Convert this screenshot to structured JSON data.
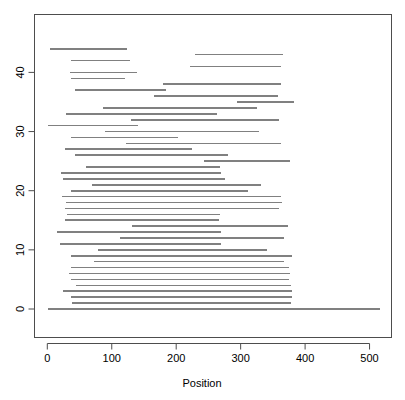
{
  "chart_data": {
    "type": "line",
    "title": "",
    "subtitle": "",
    "xlabel": "Position",
    "ylabel": "",
    "grid": false,
    "legend": "none",
    "xlim": [
      -12,
      535
    ],
    "ylim": [
      -1.2,
      46.5
    ],
    "xticks": [
      0,
      100,
      200,
      300,
      400,
      500
    ],
    "yticks": [
      0,
      10,
      20,
      30,
      40
    ],
    "xtick_labels": [
      "0",
      "100",
      "200",
      "300",
      "400",
      "500"
    ],
    "ytick_labels": [
      "0",
      "10",
      "20",
      "30",
      "40"
    ],
    "series_color": "#808080",
    "axis_color": "#4d4d4d",
    "segment_note": "Horizontal segments: each row y is an index, drawn from xstart to xend",
    "segments": [
      {
        "y": 44,
        "xstart": 4,
        "xend": 124
      },
      {
        "y": 43,
        "xstart": 229,
        "xend": 365
      },
      {
        "y": 42,
        "xstart": 37,
        "xend": 128
      },
      {
        "y": 41,
        "xstart": 222,
        "xend": 363
      },
      {
        "y": 40,
        "xstart": 35,
        "xend": 139
      },
      {
        "y": 39,
        "xstart": 36,
        "xend": 121
      },
      {
        "y": 38,
        "xstart": 180,
        "xend": 362
      },
      {
        "y": 37,
        "xstart": 43,
        "xend": 184
      },
      {
        "y": 36,
        "xstart": 166,
        "xend": 358
      },
      {
        "y": 35,
        "xstart": 294,
        "xend": 382
      },
      {
        "y": 34,
        "xstart": 87,
        "xend": 325
      },
      {
        "y": 33,
        "xstart": 29,
        "xend": 263
      },
      {
        "y": 32,
        "xstart": 130,
        "xend": 360
      },
      {
        "y": 31,
        "xstart": 1,
        "xend": 141
      },
      {
        "y": 30,
        "xstart": 90,
        "xend": 328
      },
      {
        "y": 29,
        "xstart": 36,
        "xend": 203
      },
      {
        "y": 28,
        "xstart": 122,
        "xend": 362
      },
      {
        "y": 27,
        "xstart": 28,
        "xend": 224
      },
      {
        "y": 26,
        "xstart": 43,
        "xend": 280
      },
      {
        "y": 25,
        "xstart": 243,
        "xend": 377
      },
      {
        "y": 24,
        "xstart": 60,
        "xend": 268
      },
      {
        "y": 23,
        "xstart": 21,
        "xend": 270
      },
      {
        "y": 22,
        "xstart": 24,
        "xend": 275
      },
      {
        "y": 21,
        "xstart": 69,
        "xend": 331
      },
      {
        "y": 20,
        "xstart": 37,
        "xend": 311
      },
      {
        "y": 19,
        "xstart": 23,
        "xend": 362
      },
      {
        "y": 18,
        "xstart": 29,
        "xend": 364
      },
      {
        "y": 17,
        "xstart": 27,
        "xend": 360
      },
      {
        "y": 16,
        "xstart": 30,
        "xend": 268
      },
      {
        "y": 15,
        "xstart": 28,
        "xend": 266
      },
      {
        "y": 14,
        "xstart": 132,
        "xend": 373
      },
      {
        "y": 13,
        "xstart": 15,
        "xend": 270
      },
      {
        "y": 12,
        "xstart": 113,
        "xend": 367
      },
      {
        "y": 11,
        "xstart": 20,
        "xend": 269
      },
      {
        "y": 10,
        "xstart": 78,
        "xend": 341
      },
      {
        "y": 9,
        "xstart": 37,
        "xend": 379
      },
      {
        "y": 8,
        "xstart": 73,
        "xend": 367
      },
      {
        "y": 7,
        "xstart": 37,
        "xend": 375
      },
      {
        "y": 6,
        "xstart": 34,
        "xend": 377
      },
      {
        "y": 5,
        "xstart": 36,
        "xend": 375
      },
      {
        "y": 4,
        "xstart": 45,
        "xend": 378
      },
      {
        "y": 3,
        "xstart": 24,
        "xend": 379
      },
      {
        "y": 2,
        "xstart": 37,
        "xend": 379
      },
      {
        "y": 1,
        "xstart": 38,
        "xend": 378
      },
      {
        "y": 0,
        "xstart": 1,
        "xend": 516
      }
    ]
  },
  "figure": {
    "xaxis_title": "Position"
  }
}
